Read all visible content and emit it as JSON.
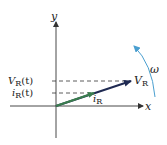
{
  "diagram": {
    "type": "phasor-diagram",
    "axes": {
      "x_label": "x",
      "y_label": "y"
    },
    "phasors": [
      {
        "name": "V_R",
        "label_main": "V",
        "label_sub": "R",
        "color": "#1f2a52",
        "description": "voltage phasor"
      },
      {
        "name": "i_R",
        "label_main": "i",
        "label_sub": "R",
        "color": "#3a7d4e",
        "description": "current phasor"
      }
    ],
    "projections": [
      {
        "label_main": "V",
        "label_sub": "R",
        "label_arg": "(t)"
      },
      {
        "label_main": "i",
        "label_sub": "R",
        "label_arg": "(t)"
      }
    ],
    "rotation": {
      "label": "ω",
      "color": "#4a9fd0"
    },
    "colors": {
      "axis": "#333333",
      "dashed": "#333333",
      "background": "#ffffff"
    }
  }
}
